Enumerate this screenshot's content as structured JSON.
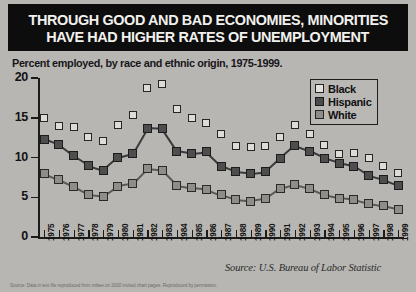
{
  "banner": {
    "line1": "THROUGH GOOD AND BAD ECONOMIES, MINORITIES",
    "line2": "HAVE HAD HIGHER RATES OF UNEMPLOYMENT"
  },
  "subtitle": "Percent employed, by race and ethnic origin, 1975-1999.",
  "source": "Source: U.S. Bureau of Labor Statistic",
  "caption": "Source: Data in text file reproduced from mittee on 2000 invited chart pages. Reproduced by permission.",
  "legend": {
    "items": [
      {
        "label": "Black",
        "swatch": "black"
      },
      {
        "label": "Hispanic",
        "swatch": "hisp"
      },
      {
        "label": "White",
        "swatch": "white"
      }
    ]
  },
  "chart_data": {
    "type": "line",
    "title": "THROUGH GOOD AND BAD ECONOMIES, MINORITIES HAVE HAD HIGHER RATES OF UNEMPLOYMENT",
    "subtitle": "Percent employed, by race and ethnic origin, 1975-1999.",
    "xlabel": "",
    "ylabel": "",
    "ylim": [
      0,
      20
    ],
    "yticks": [
      0,
      5,
      10,
      15,
      20
    ],
    "grid": false,
    "legend_position": "top-right",
    "categories": [
      "1975",
      "1976",
      "1977",
      "1978",
      "1979",
      "1980",
      "1981",
      "1982",
      "1983",
      "1984",
      "1985",
      "1986",
      "1987",
      "1988",
      "1989",
      "1990",
      "1991",
      "1992",
      "1993",
      "1994",
      "1995",
      "1996",
      "1997",
      "1998",
      "1999"
    ],
    "series": [
      {
        "name": "Black",
        "values": [
          15.0,
          13.9,
          13.8,
          12.6,
          12.1,
          14.1,
          15.4,
          18.7,
          19.3,
          16.1,
          15.0,
          14.3,
          12.9,
          11.5,
          11.3,
          11.4,
          12.6,
          14.1,
          12.9,
          11.6,
          10.4,
          10.6,
          10.0,
          8.9,
          8.0
        ]
      },
      {
        "name": "Hispanic",
        "values": [
          12.3,
          11.6,
          10.2,
          9.0,
          8.4,
          10.0,
          10.5,
          13.7,
          13.6,
          10.8,
          10.5,
          10.7,
          8.9,
          8.2,
          8.0,
          8.2,
          9.9,
          11.5,
          10.8,
          9.9,
          9.3,
          8.9,
          7.7,
          7.2,
          6.5
        ]
      },
      {
        "name": "White",
        "values": [
          8.0,
          7.2,
          6.3,
          5.3,
          5.1,
          6.4,
          6.7,
          8.6,
          8.4,
          6.5,
          6.2,
          6.0,
          5.3,
          4.7,
          4.5,
          4.8,
          6.1,
          6.6,
          6.1,
          5.3,
          4.9,
          4.7,
          4.2,
          3.9,
          3.5
        ]
      }
    ]
  }
}
